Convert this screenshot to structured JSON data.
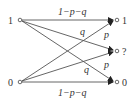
{
  "diagram": {
    "type": "binary-erasure-error-channel",
    "inputs": [
      {
        "label": "1",
        "x": 20,
        "y": 20
      },
      {
        "label": "0",
        "x": 20,
        "y": 82
      }
    ],
    "outputs": [
      {
        "label": "1",
        "x": 117,
        "y": 20
      },
      {
        "label": "?",
        "x": 117,
        "y": 51
      },
      {
        "label": "0",
        "x": 117,
        "y": 82
      }
    ],
    "edges": [
      {
        "from": "1",
        "to": "1",
        "label": "1−p−q"
      },
      {
        "from": "1",
        "to": "?",
        "label": "q"
      },
      {
        "from": "1",
        "to": "0",
        "label": "p"
      },
      {
        "from": "0",
        "to": "1",
        "label": "p"
      },
      {
        "from": "0",
        "to": "?",
        "label": "q"
      },
      {
        "from": "0",
        "to": "0",
        "label": "1−p−q"
      }
    ],
    "labels": {
      "top": "1−p−q",
      "bottom": "1−p−q",
      "q_upper": "q",
      "p_upper": "p",
      "q_lower": "q",
      "p_lower": "p",
      "in1": "1",
      "in0": "0",
      "out1": "1",
      "outq": "?",
      "out0": "0"
    },
    "colors": {
      "line": "#555555",
      "text": "#333333"
    }
  }
}
